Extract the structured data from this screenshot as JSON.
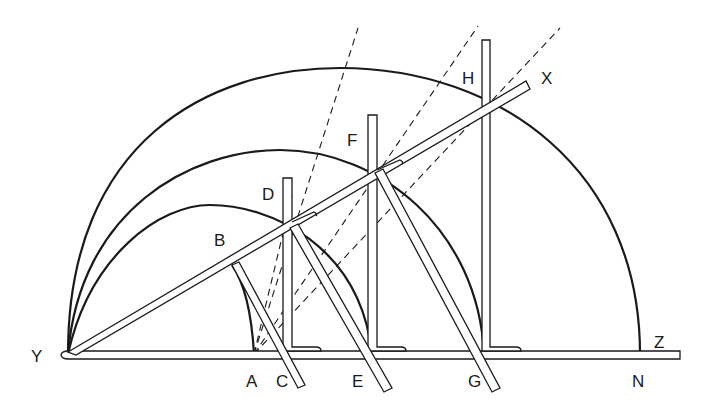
{
  "figure": {
    "labels": {
      "Y": "Y",
      "A": "A",
      "B": "B",
      "C": "C",
      "D": "D",
      "E": "E",
      "F": "F",
      "G": "G",
      "H": "H",
      "N": "N",
      "X": "X",
      "Z": "Z"
    },
    "colors": {
      "ink": "#1a1a1a",
      "background": "#ffffff"
    }
  }
}
